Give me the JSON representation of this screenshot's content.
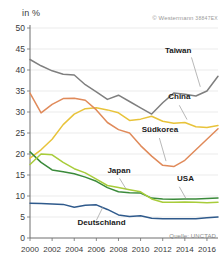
{
  "header": {
    "y_axis_unit": "in %",
    "copyright": "© Westermann",
    "copyright_code": "38847EX",
    "source": "Quelle: UNCTAD"
  },
  "chart_data": {
    "type": "line",
    "title": "",
    "xlabel": "",
    "ylabel": "in %",
    "xlim": [
      2000,
      2017
    ],
    "ylim": [
      0,
      50
    ],
    "ytick_step": 5,
    "grid": true,
    "legend": "inline-labels",
    "yticks": [
      0,
      5,
      10,
      15,
      20,
      25,
      30,
      35,
      40,
      45,
      50
    ],
    "ytick_labels": [
      "0",
      "5",
      "10",
      "15",
      "20",
      "25",
      "30",
      "35",
      "40",
      "45",
      "50"
    ],
    "xticks": [
      2000,
      2002,
      2004,
      2006,
      2008,
      2010,
      2012,
      2014,
      2016
    ],
    "xtick_labels": [
      "2000",
      "2002",
      "2004",
      "2006",
      "2008",
      "2010",
      "2012",
      "2014",
      "2016"
    ],
    "x": [
      2000,
      2001,
      2002,
      2003,
      2004,
      2005,
      2006,
      2007,
      2008,
      2009,
      2010,
      2011,
      2012,
      2013,
      2014,
      2015,
      2016,
      2017
    ],
    "series": [
      {
        "name": "Taiwan",
        "color": "#7f7f7f",
        "label_x": 2012.2,
        "label_y": 44.0,
        "values": [
          42.5,
          41.0,
          39.8,
          39.0,
          38.8,
          36.5,
          34.8,
          33.0,
          34.0,
          32.5,
          31.0,
          29.5,
          32.2,
          34.5,
          34.2,
          33.8,
          35.0,
          38.5
        ]
      },
      {
        "name": "China",
        "color": "#e8c33a",
        "label_x": 2012.5,
        "label_y": 33.0,
        "values": [
          19.0,
          21.0,
          23.5,
          27.0,
          29.5,
          30.8,
          31.0,
          30.5,
          29.8,
          28.0,
          28.3,
          29.0,
          27.8,
          27.3,
          27.5,
          26.5,
          26.3,
          26.8
        ]
      },
      {
        "name": "Südkorea",
        "color": "#e08a5a",
        "label_x": 2010.1,
        "label_y": 25.3,
        "values": [
          34.5,
          29.8,
          31.8,
          33.2,
          33.3,
          32.8,
          30.5,
          27.5,
          25.8,
          25.0,
          22.0,
          19.5,
          17.3,
          17.0,
          18.5,
          21.0,
          23.5,
          26.0
        ]
      },
      {
        "name": "Japan",
        "color": "#3a8a3a",
        "label_x": 2007.0,
        "label_y": 15.5,
        "values": [
          20.5,
          18.0,
          16.2,
          15.8,
          15.3,
          14.5,
          13.5,
          12.0,
          11.0,
          10.8,
          10.7,
          9.5,
          9.3,
          9.2,
          9.3,
          9.3,
          9.4,
          9.5
        ]
      },
      {
        "name": "USA",
        "color": "#a8cc3a",
        "label_x": 2013.3,
        "label_y": 13.5,
        "values": [
          17.5,
          20.0,
          19.8,
          18.0,
          16.5,
          15.5,
          14.0,
          12.5,
          12.0,
          11.5,
          11.0,
          9.3,
          8.5,
          8.5,
          8.6,
          8.5,
          8.4,
          8.5
        ]
      },
      {
        "name": "Deutschland",
        "color": "#2f5a8c",
        "label_x": 2004.3,
        "label_y": 3.2,
        "values": [
          8.3,
          8.2,
          8.1,
          8.0,
          7.3,
          7.8,
          7.9,
          6.8,
          5.5,
          5.1,
          5.3,
          4.7,
          4.6,
          4.6,
          4.6,
          4.6,
          4.8,
          5.0
        ]
      }
    ],
    "label_leaders": [
      {
        "name": "Taiwan",
        "x1": 2014.6,
        "y1": 43.0,
        "x2": 2015.4,
        "y2": 36.0
      },
      {
        "name": "China",
        "x1": 2013.5,
        "y1": 31.6,
        "x2": 2014.2,
        "y2": 28.2
      },
      {
        "name": "Südkorea",
        "x1": 2011.7,
        "y1": 23.8,
        "x2": 2012.3,
        "y2": 18.3
      },
      {
        "name": "Japan",
        "x1": 2008.1,
        "y1": 14.2,
        "x2": 2008.7,
        "y2": 11.6
      },
      {
        "name": "USA",
        "x1": 2013.5,
        "y1": 12.2,
        "x2": 2014.1,
        "y2": 9.4
      },
      {
        "name": "Deutschland",
        "x1": 2006.0,
        "y1": 4.2,
        "x2": 2006.6,
        "y2": 7.4
      }
    ]
  }
}
